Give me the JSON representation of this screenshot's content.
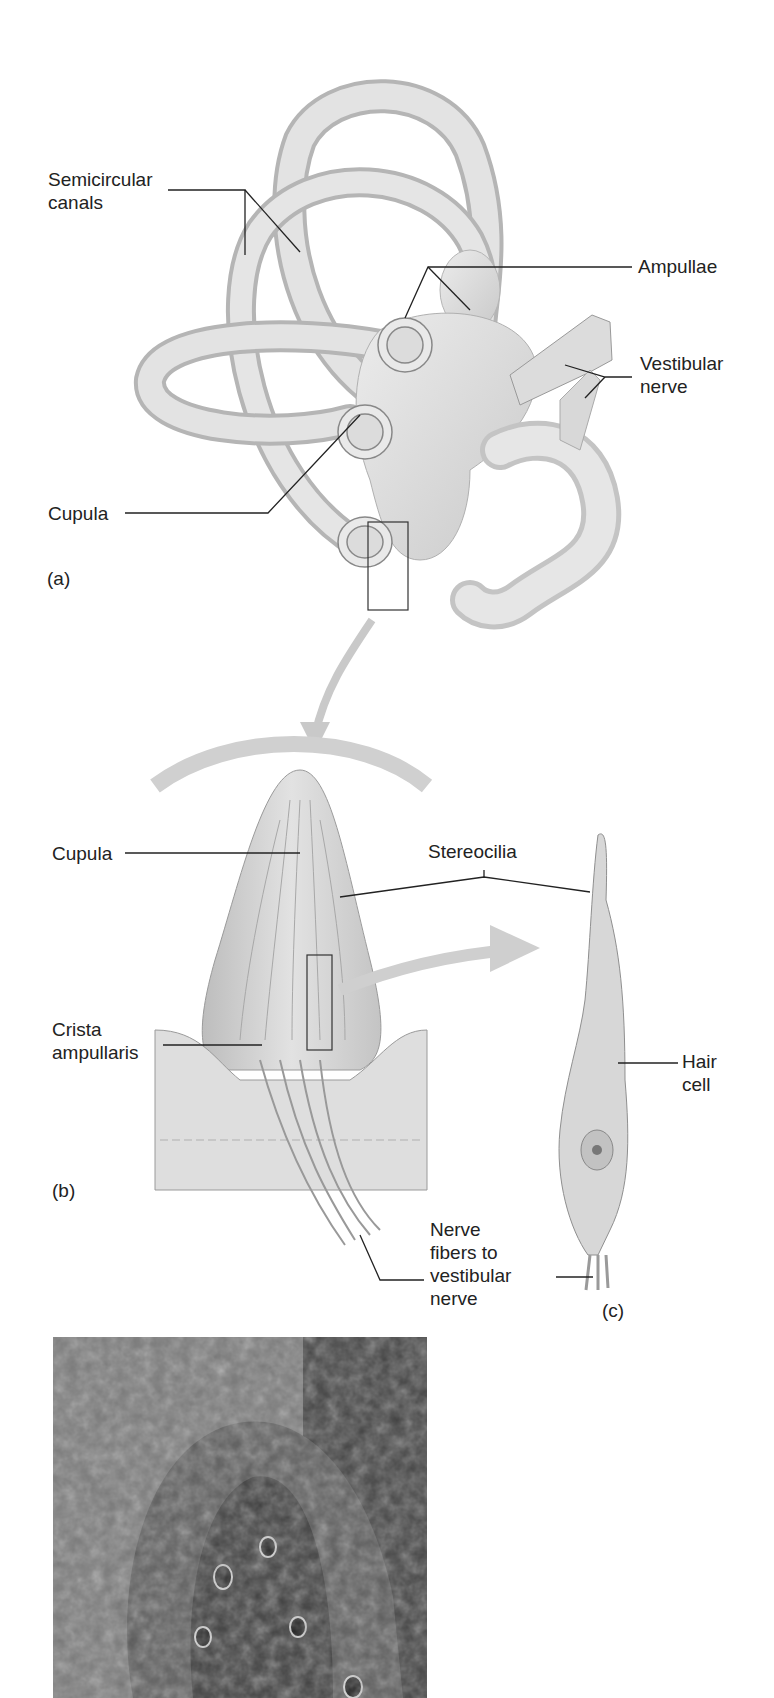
{
  "figure": {
    "panel_a": {
      "tag": "(a)",
      "labels": {
        "semicircular_canals": [
          "Semicircular",
          "canals"
        ],
        "ampullae": "Ampullae",
        "vestibular_nerve": [
          "Vestibular",
          "nerve"
        ],
        "cupula": "Cupula"
      }
    },
    "panel_b": {
      "tag": "(b)",
      "labels": {
        "cupula": "Cupula",
        "stereocilia": "Stereocilia",
        "crista_ampullaris": [
          "Crista",
          "ampullaris"
        ],
        "nerve_fibers": [
          "Nerve",
          "fibers to",
          "vestibular",
          "nerve"
        ]
      }
    },
    "panel_c": {
      "tag": "(c)",
      "labels": {
        "hair_cell": [
          "Hair",
          "cell"
        ]
      }
    },
    "micrograph": {
      "description": "scanning electron micrograph of crista ampullaris"
    }
  },
  "colors": {
    "background": "#ffffff",
    "structure_fill": "#d9d9d9",
    "structure_edge": "#9a9a9a",
    "leader_line": "#222222",
    "text": "#222222"
  }
}
